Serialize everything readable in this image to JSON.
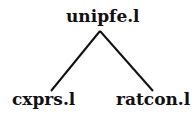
{
  "diagram": {
    "type": "tree",
    "root": {
      "label": "unipfe.l"
    },
    "children": [
      {
        "label": "cxprs.l"
      },
      {
        "label": "ratcon.l"
      }
    ],
    "edges": [
      {
        "from": "unipfe.l",
        "to": "cxprs.l"
      },
      {
        "from": "unipfe.l",
        "to": "ratcon.l"
      }
    ],
    "colors": {
      "line": "#111111",
      "text": "#111111",
      "background": "#ffffff"
    }
  }
}
